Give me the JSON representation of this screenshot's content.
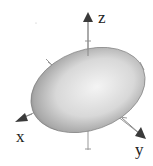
{
  "figure": {
    "type": "3d-ellipsoid",
    "axes": [
      {
        "name": "x",
        "label": "x"
      },
      {
        "name": "y",
        "label": "y"
      },
      {
        "name": "z",
        "label": "z"
      }
    ],
    "colors": {
      "surface_light": "#f2f2f2",
      "surface_dark": "#6e6e6e",
      "axis": "#888888",
      "arrowhead": "#3a3a3a"
    }
  }
}
